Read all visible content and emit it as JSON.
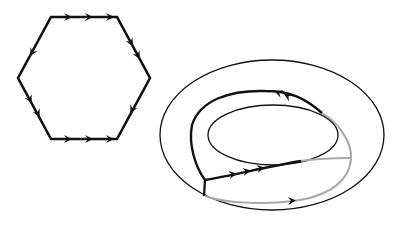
{
  "figure": {
    "colors": {
      "background": "#ffffff",
      "ink": "#111111",
      "gray_curve": "#a8a8a8"
    }
  },
  "hexagon": {
    "label": "hexagon-with-edge-identifications",
    "vertices": [
      [
        51,
        17
      ],
      [
        117,
        17
      ],
      [
        150,
        78
      ],
      [
        117,
        139
      ],
      [
        51,
        139
      ],
      [
        18,
        78
      ]
    ],
    "edges": [
      {
        "name": "top",
        "arrows": 3,
        "direction": "right"
      },
      {
        "name": "upper-right",
        "arrows": 2,
        "direction": "down-right"
      },
      {
        "name": "lower-right",
        "arrows": 1,
        "direction": "down-left"
      },
      {
        "name": "bottom",
        "arrows": 3,
        "direction": "right"
      },
      {
        "name": "lower-left",
        "arrows": 2,
        "direction": "down-right"
      },
      {
        "name": "upper-left",
        "arrows": 1,
        "direction": "down-left"
      }
    ]
  },
  "torus": {
    "label": "torus-with-curves",
    "outer_ellipse": {
      "cx": 272,
      "cy": 135,
      "rx": 112,
      "ry": 75
    },
    "inner_ellipse": {
      "cx": 273,
      "cy": 135,
      "rx": 65,
      "ry": 30
    },
    "curves": [
      {
        "name": "black-upper-loop",
        "color": "black",
        "arrows": 2,
        "direction": "left"
      },
      {
        "name": "black-lower-path",
        "color": "black",
        "arrows": 3,
        "direction": "right"
      },
      {
        "name": "gray-lower-path",
        "color": "gray",
        "arrows": 1,
        "direction": "right"
      },
      {
        "name": "gray-right-arc",
        "color": "gray",
        "arrows": 0
      }
    ]
  }
}
